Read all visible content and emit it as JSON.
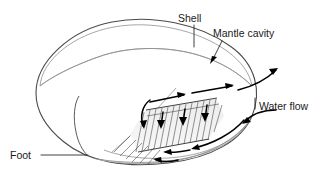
{
  "figure": {
    "background_color": "#ffffff",
    "width": 321,
    "height": 177
  },
  "labels": {
    "shell": "Shell",
    "mantle_cavity": "Mantle cavity",
    "water_flow": "Water flow",
    "foot": "Foot"
  },
  "colors": {
    "text": "#1a1a1a",
    "outline": "#4a4a4a",
    "arrow": "#000000",
    "shell_fill_light": "#fbfbfb",
    "shell_fill_mid": "#e8e8e8",
    "shell_fill_dark": "#cfcfcf",
    "gill_line": "#3a3a3a",
    "leader": "#2a2a2a"
  },
  "structures": {
    "shell_name": "shell-body",
    "gill_name": "gill-lamellae",
    "foot_name": "foot-structure",
    "mantle_name": "mantle-cavity-region"
  },
  "flow": {
    "inhalant_label": "inhalant current",
    "exhalant_label": "exhalant current",
    "through_gill_label": "flow through gills"
  }
}
